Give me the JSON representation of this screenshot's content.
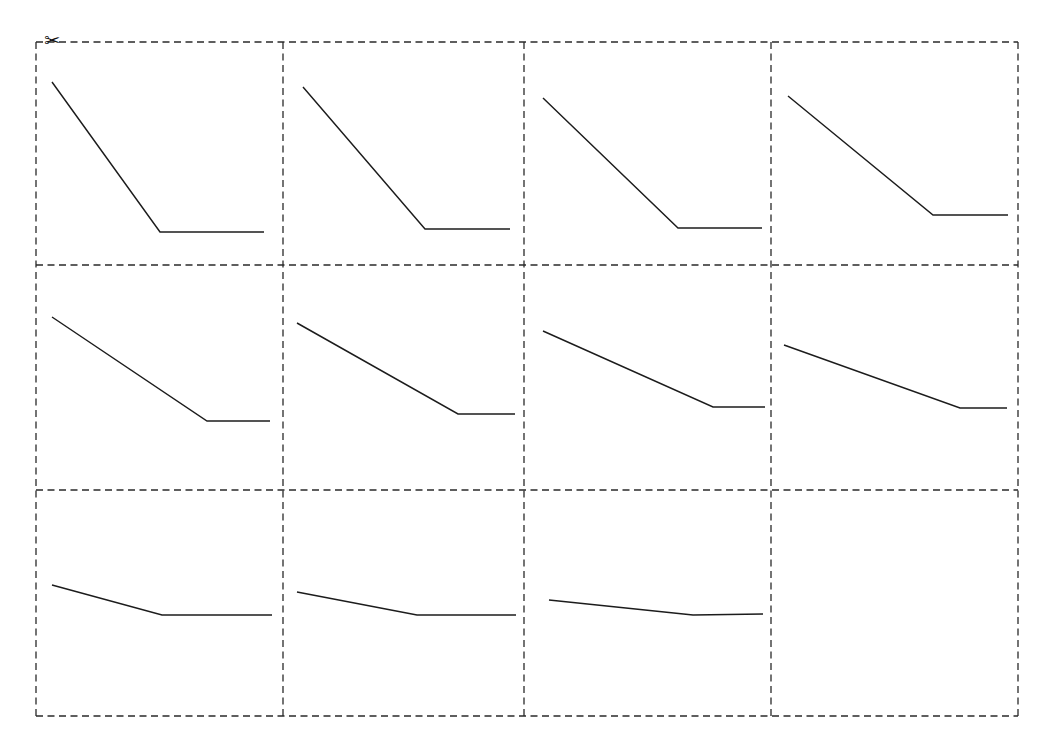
{
  "page": {
    "background_color": "#ffffff",
    "width": 1037,
    "height": 744
  },
  "cut_guide": {
    "label": "cut along dashed lines",
    "scissors_glyph": "✂",
    "line_color": "#2a2a2a",
    "dash": "7 4.5",
    "columns": 4,
    "rows": 3,
    "x_edges": [
      36,
      283,
      524,
      771,
      1018
    ],
    "y_edges": [
      42,
      265,
      490,
      716
    ]
  },
  "chart_data": {
    "type": "line",
    "subtitle": "",
    "xlabel": "",
    "ylabel": "",
    "grid": false,
    "legend": "none",
    "axis_visible": false,
    "tick_labels": [],
    "annotations": [
      "scissors cut marker at top-left corner"
    ],
    "panel_layout": {
      "rows": 3,
      "cols": 4,
      "total_panels": 12,
      "empty_panels": [
        12
      ]
    },
    "line_color": "#1c1c1c",
    "x": [
      0,
      1,
      2
    ],
    "panels": [
      {
        "id": 1,
        "row": 1,
        "col": 1,
        "empty": false,
        "points": [
          [
            52,
            82
          ],
          [
            160,
            232
          ],
          [
            264,
            232
          ]
        ],
        "values": [
          1.0,
          0.0,
          0.0
        ],
        "knee_x": 0.45,
        "slope": -2.22
      },
      {
        "id": 2,
        "row": 2,
        "col": 2,
        "empty": false,
        "points": [
          [
            303,
            87
          ],
          [
            425,
            229
          ],
          [
            510,
            229
          ]
        ],
        "values": [
          1.0,
          0.0,
          0.0
        ],
        "knee_x": 0.59,
        "slope": -1.7
      },
      {
        "id": 3,
        "row": 1,
        "col": 3,
        "empty": false,
        "points": [
          [
            543,
            98
          ],
          [
            678,
            228
          ],
          [
            762,
            228
          ]
        ],
        "values": [
          0.93,
          0.0,
          0.0
        ],
        "knee_x": 0.62,
        "slope": -1.5
      },
      {
        "id": 4,
        "row": 1,
        "col": 4,
        "empty": false,
        "points": [
          [
            788,
            96
          ],
          [
            933,
            215
          ],
          [
            1008,
            215
          ]
        ],
        "values": [
          0.88,
          0.05,
          0.05
        ],
        "knee_x": 0.66,
        "slope": -1.26
      },
      {
        "id": 5,
        "row": 2,
        "col": 1,
        "empty": false,
        "points": [
          [
            52,
            317
          ],
          [
            207,
            421
          ],
          [
            270,
            421
          ]
        ],
        "values": [
          0.72,
          0.0,
          0.0
        ],
        "knee_x": 0.71,
        "slope": -0.94
      },
      {
        "id": 6,
        "row": 2,
        "col": 2,
        "empty": false,
        "points": [
          [
            297,
            323
          ],
          [
            458,
            414
          ],
          [
            515,
            414
          ]
        ],
        "values": [
          0.66,
          0.0,
          0.0
        ],
        "knee_x": 0.74,
        "slope": -0.79
      },
      {
        "id": 7,
        "row": 2,
        "col": 3,
        "empty": false,
        "points": [
          [
            543,
            331
          ],
          [
            713,
            407
          ],
          [
            765,
            407
          ]
        ],
        "values": [
          0.59,
          0.0,
          0.0
        ],
        "knee_x": 0.76,
        "slope": -0.63
      },
      {
        "id": 8,
        "row": 2,
        "col": 4,
        "empty": false,
        "points": [
          [
            784,
            345
          ],
          [
            960,
            408
          ],
          [
            1007,
            408
          ]
        ],
        "values": [
          0.47,
          0.0,
          0.0
        ],
        "knee_x": 0.79,
        "slope": -0.5
      },
      {
        "id": 9,
        "row": 3,
        "col": 1,
        "empty": false,
        "points": [
          [
            52,
            585
          ],
          [
            162,
            615
          ],
          [
            272,
            615
          ]
        ],
        "values": [
          0.25,
          0.0,
          0.0
        ],
        "knee_x": 0.5,
        "slope": -0.5
      },
      {
        "id": 10,
        "row": 3,
        "col": 2,
        "empty": false,
        "points": [
          [
            297,
            592
          ],
          [
            417,
            615
          ],
          [
            516,
            615
          ]
        ],
        "values": [
          0.19,
          0.0,
          0.0
        ],
        "knee_x": 0.55,
        "slope": -0.35
      },
      {
        "id": 11,
        "row": 3,
        "col": 3,
        "empty": false,
        "points": [
          [
            549,
            600
          ],
          [
            693,
            615
          ],
          [
            763,
            614
          ]
        ],
        "values": [
          0.13,
          0.0,
          0.01
        ],
        "knee_x": 0.67,
        "slope": -0.19
      },
      {
        "id": 12,
        "row": 3,
        "col": 4,
        "empty": true,
        "points": [],
        "values": [],
        "knee_x": null,
        "slope": null
      }
    ]
  }
}
